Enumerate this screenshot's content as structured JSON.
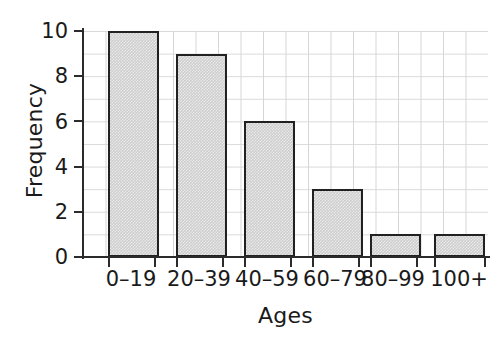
{
  "chart_data": {
    "type": "bar",
    "title": "",
    "subtitle": "",
    "categories": [
      "0–19",
      "20–39",
      "40–59",
      "60–79",
      "80–99",
      "100+"
    ],
    "values": [
      10,
      9,
      6,
      3,
      1,
      1
    ],
    "xlabel": "Ages",
    "ylabel": "Frequency",
    "ylim": [
      0,
      10
    ],
    "ytick_labels": [
      "0",
      "2",
      "4",
      "6",
      "8",
      "10"
    ],
    "ytick_values": [
      0,
      2,
      4,
      6,
      8,
      10
    ],
    "ytick_step": 2,
    "grid": "both, minor step 1 on y",
    "legend": "none",
    "bar_fill_color": "#cdcdcd",
    "bar_edge_color": "#212121",
    "grid_color": "#d8d8d8",
    "background_color": "#ffffff",
    "text_color": "#1a1a1a"
  }
}
